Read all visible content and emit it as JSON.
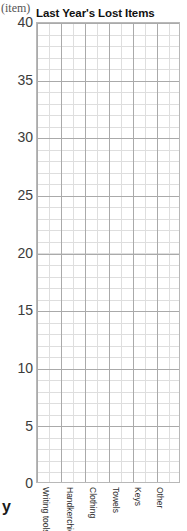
{
  "chart_data": {
    "type": "bar",
    "title": "Last Year's Lost Items",
    "xlabel": "",
    "ylabel": "(item)",
    "ylim": [
      0,
      40
    ],
    "yticks": [
      0,
      5,
      10,
      15,
      20,
      25,
      30,
      35,
      40
    ],
    "ytick_labels": [
      "0",
      "5",
      "10",
      "15",
      "20",
      "25",
      "30",
      "35",
      "40"
    ],
    "grid": true,
    "legend": "none",
    "categories": [
      "Writing tools",
      "Handkerchief",
      "Clothing",
      "Towels",
      "Keys",
      "Other"
    ],
    "values": [
      null,
      null,
      null,
      null,
      null,
      null
    ],
    "note": "empty grid - no bars drawn"
  },
  "axis": {
    "unit_label": "(item)",
    "bottom_clipped_label": "y"
  }
}
